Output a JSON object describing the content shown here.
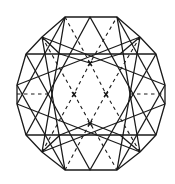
{
  "diagram": {
    "type": "gemstone-facet-diagram",
    "stroke_color": "#1a1a1a",
    "background": "#ffffff",
    "outline_vertices": [
      [
        65,
        17
      ],
      [
        117,
        17
      ],
      [
        140,
        37
      ],
      [
        156,
        54
      ],
      [
        165,
        85
      ],
      [
        165,
        104
      ],
      [
        156,
        135
      ],
      [
        140,
        152
      ],
      [
        117,
        170
      ],
      [
        65,
        170
      ],
      [
        42,
        152
      ],
      [
        26,
        135
      ],
      [
        17,
        104
      ],
      [
        17,
        85
      ],
      [
        26,
        54
      ],
      [
        42,
        37
      ]
    ],
    "inner_markers": [
      [
        90,
        63
      ],
      [
        74,
        94
      ],
      [
        106,
        94
      ],
      [
        90,
        123
      ]
    ]
  }
}
